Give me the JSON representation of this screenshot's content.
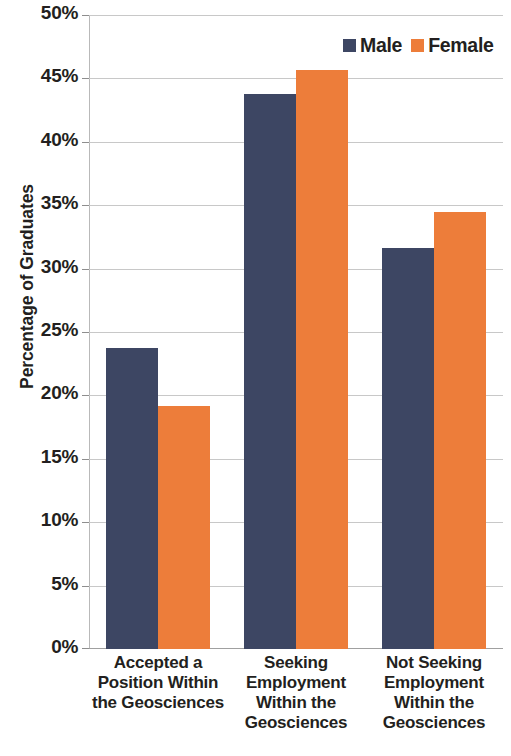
{
  "chart_data": {
    "type": "bar",
    "title": "",
    "xlabel": "",
    "ylabel": "Percentage of Graduates",
    "ylim": [
      0,
      50
    ],
    "ytick_step": 5,
    "grid": true,
    "legend_position": "top-right",
    "categories": [
      "Accepted a Position Within the Geosciences",
      "Seeking Employment Within the Geosciences",
      "Not Seeking Employment Within the Geosciences"
    ],
    "category_lines": [
      [
        "Accepted a",
        "Position Within",
        "the Geosciences"
      ],
      [
        "Seeking",
        "Employment",
        "Within the",
        "Geosciences"
      ],
      [
        "Not Seeking",
        "Employment",
        "Within the",
        "Geosciences"
      ]
    ],
    "series": [
      {
        "name": "Male",
        "color": "#3d4663",
        "values": [
          23.7,
          43.8,
          31.6
        ]
      },
      {
        "name": "Female",
        "color": "#ed7d3a",
        "values": [
          19.2,
          45.7,
          34.5
        ]
      }
    ],
    "ytick_labels": [
      "0%",
      "5%",
      "10%",
      "15%",
      "20%",
      "25%",
      "30%",
      "35%",
      "40%",
      "45%",
      "50%"
    ],
    "ytick_values": [
      0,
      5,
      10,
      15,
      20,
      25,
      30,
      35,
      40,
      45,
      50
    ]
  },
  "colors": {
    "male": "#3d4663",
    "female": "#ed7d3a",
    "gridline": "#c8c8c8",
    "axis": "#a0a0a0",
    "text": "#231f20",
    "background": "#ffffff"
  },
  "legend": {
    "entries": [
      {
        "label": "Male",
        "swatch": "male-swatch"
      },
      {
        "label": "Female",
        "swatch": "female-swatch"
      }
    ]
  }
}
